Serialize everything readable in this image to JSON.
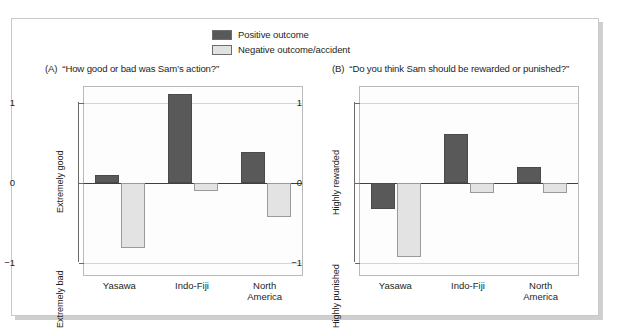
{
  "legend": {
    "items": [
      {
        "label": "Positive outcome",
        "color": "#595959",
        "key": "positive"
      },
      {
        "label": "Negative outcome/accident",
        "color": "#e2e2e2",
        "key": "negative"
      }
    ]
  },
  "panels": [
    {
      "tag": "(A)",
      "title": "“How good or bad was Sam’s action?”",
      "y_top_label": "Extremely good",
      "y_bottom_label": "Extremely bad"
    },
    {
      "tag": "(B)",
      "title": "“Do you think Sam should be rewarded or punished?”",
      "y_top_label": "Highly rewarded",
      "y_bottom_label": "Highly punished"
    }
  ],
  "axis": {
    "yticks": [
      "1",
      "0",
      "−1"
    ],
    "ytick_values": [
      1,
      0,
      -1
    ],
    "categories": [
      "Yasawa",
      "Indo-Fiji",
      "North\nAmerica"
    ]
  },
  "chart_data": [
    {
      "type": "bar",
      "title": "(A) “How good or bad was Sam’s action?”",
      "xlabel": "",
      "ylabel": "Extremely bad – Extremely good",
      "ylim": [
        -1.15,
        1.2
      ],
      "yticks": [
        1,
        0,
        -1
      ],
      "ytick_labels": [
        "1",
        "0",
        "−1"
      ],
      "grid": true,
      "legend_position": "top-center",
      "categories": [
        "Yasawa",
        "Indo-Fiji",
        "North America"
      ],
      "series": [
        {
          "name": "Positive outcome",
          "color": "#595959",
          "values": [
            0.1,
            1.11,
            0.39
          ]
        },
        {
          "name": "Negative outcome/accident",
          "color": "#e2e2e2",
          "values": [
            -0.81,
            -0.1,
            -0.42
          ]
        }
      ]
    },
    {
      "type": "bar",
      "title": "(B) “Do you think Sam should be rewarded or punished?”",
      "xlabel": "",
      "ylabel": "Highly punished – Highly rewarded",
      "ylim": [
        -1.15,
        1.2
      ],
      "yticks": [
        1,
        0,
        -1
      ],
      "ytick_labels": [
        "1",
        "0",
        "−1"
      ],
      "grid": true,
      "legend_position": "top-center",
      "categories": [
        "Yasawa",
        "Indo-Fiji",
        "North America"
      ],
      "series": [
        {
          "name": "Positive outcome",
          "color": "#595959",
          "values": [
            -0.32,
            0.61,
            0.2
          ]
        },
        {
          "name": "Negative outcome/accident",
          "color": "#e2e2e2",
          "values": [
            -0.92,
            -0.12,
            -0.12
          ]
        }
      ]
    }
  ]
}
